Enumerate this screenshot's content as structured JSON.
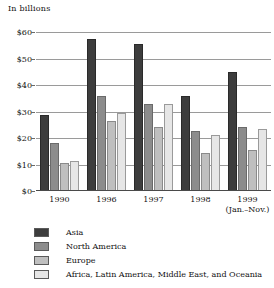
{
  "chart_data": {
    "type": "bar",
    "title": "In billions",
    "xlabel": "",
    "ylabel": "In billions",
    "ylim": [
      0,
      60
    ],
    "ytick_labels": [
      "$60",
      "$50",
      "$40",
      "$30",
      "$20",
      "$10",
      "$0"
    ],
    "ytick_values": [
      60,
      50,
      40,
      30,
      20,
      10,
      0
    ],
    "grid": true,
    "legend_position": "below",
    "categories": [
      "1990",
      "1996",
      "1997",
      "1998",
      "1999"
    ],
    "category_sublabels": [
      "",
      "",
      "",
      "",
      "(Jan.–Nov.)"
    ],
    "series": [
      {
        "name": "Asia",
        "color": "#3d3d3d",
        "values": [
          28.5,
          57.5,
          55.5,
          35.8,
          45.0
        ]
      },
      {
        "name": "North America",
        "color": "#8c8c8c",
        "values": [
          18.3,
          36.0,
          33.0,
          22.5,
          24.3
        ]
      },
      {
        "name": "Europe",
        "color": "#bfbfbf",
        "values": [
          10.5,
          26.3,
          24.0,
          14.5,
          15.3
        ]
      },
      {
        "name": "Africa, Latin America, Middle East, and Oceania",
        "color": "#e6e6e6",
        "values": [
          11.5,
          29.5,
          33.0,
          21.0,
          23.3
        ]
      }
    ]
  },
  "legend": {
    "items": [
      {
        "label": "Asia"
      },
      {
        "label": "North America"
      },
      {
        "label": "Europe"
      },
      {
        "label": "Africa, Latin America, Middle East, and Oceania"
      }
    ]
  }
}
